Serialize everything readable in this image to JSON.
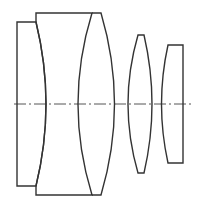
{
  "diagram": {
    "type": "optical-lens-cross-section",
    "stroke_color": "#333333",
    "axis_color": "#555555",
    "background": "#ffffff",
    "elements": [
      {
        "name": "cemented-doublet-front",
        "description": "plano / concave front element cemented with meniscus"
      },
      {
        "name": "meniscus-element",
        "description": "thick element with concave front and convex rear"
      },
      {
        "name": "biconvex-element",
        "description": "thin biconvex lens"
      },
      {
        "name": "plano-convex-element",
        "description": "plano-convex rear lens"
      }
    ],
    "optical_axis": {
      "style": "dash-dot",
      "y": 104
    }
  }
}
